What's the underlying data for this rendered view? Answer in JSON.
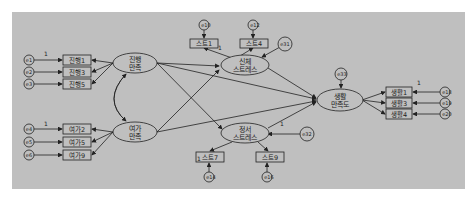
{
  "diagram": {
    "type": "structural-equation-model",
    "background_color": "#bfbfbf",
    "line_color": "#222222",
    "latent_variables": [
      {
        "id": "prog",
        "label_line1": "진행",
        "label_line2": "만족",
        "cx": 135,
        "cy": 63
      },
      {
        "id": "leisure",
        "label_line1": "여가",
        "label_line2": "만족",
        "cx": 135,
        "cy": 132
      },
      {
        "id": "phys",
        "label_line1": "신체",
        "label_line2": "스트레스",
        "cx": 245,
        "cy": 65
      },
      {
        "id": "emo",
        "label_line1": "정서",
        "label_line2": "스트레스",
        "cx": 245,
        "cy": 133
      },
      {
        "id": "life",
        "label_line1": "생활",
        "label_line2": "만족도",
        "cx": 340,
        "cy": 100
      }
    ],
    "observed_left_top": [
      {
        "label": "진행1",
        "error": "e1"
      },
      {
        "label": "진행3",
        "error": "e2"
      },
      {
        "label": "진행5",
        "error": "e3"
      }
    ],
    "observed_left_bottom": [
      {
        "label": "여가2",
        "error": "e4"
      },
      {
        "label": "여가5",
        "error": "e5"
      },
      {
        "label": "여가9",
        "error": "e6"
      }
    ],
    "observed_phys": [
      {
        "label": "스트1",
        "error": "e10"
      },
      {
        "label": "스트4",
        "error": "e12"
      }
    ],
    "observed_emo": [
      {
        "label": "스트7",
        "error": "e14"
      },
      {
        "label": "스트9",
        "error": "e16"
      }
    ],
    "observed_right": [
      {
        "label": "생활1",
        "error": "e18"
      },
      {
        "label": "생활3",
        "error": "e19"
      },
      {
        "label": "생활4",
        "error": "e20"
      }
    ],
    "disturbances": [
      {
        "label": "e31",
        "target": "phys"
      },
      {
        "label": "e32",
        "target": "emo"
      },
      {
        "label": "e33",
        "target": "life"
      }
    ],
    "fixed_path_label": "1"
  }
}
